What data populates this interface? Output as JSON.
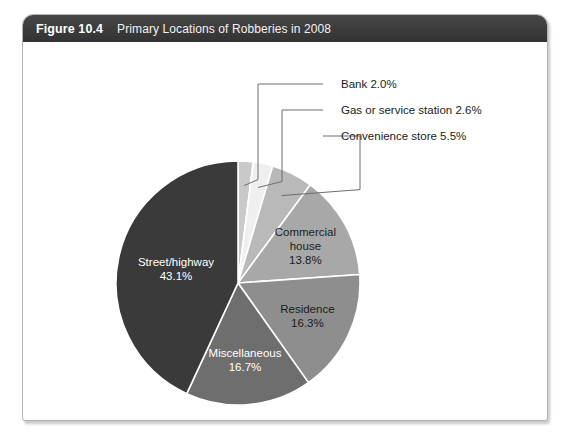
{
  "figure": {
    "number": "Figure 10.4",
    "title": "Primary Locations of Robberies in 2008"
  },
  "chart_data": {
    "type": "pie",
    "title": "Primary Locations of Robberies in 2008",
    "value_unit": "percent",
    "total": 100.0,
    "legend_position": "none",
    "grid": false,
    "labels_inside": true,
    "categories": [
      "Bank",
      "Gas or service station",
      "Convenience store",
      "Commercial house",
      "Residence",
      "Miscellaneous",
      "Street/highway"
    ],
    "values": [
      2.0,
      2.6,
      5.5,
      13.8,
      16.3,
      16.7,
      43.1
    ],
    "slices": [
      {
        "name": "Bank",
        "value": 2.0,
        "value_label": "2.0%",
        "callout_label": "Bank 2.0%",
        "color": "#c9c9c9",
        "label_style": "callout",
        "label_text_color": "#1c1c1c"
      },
      {
        "name": "Gas or service station",
        "value": 2.6,
        "value_label": "2.6%",
        "callout_label": "Gas or service station 2.6%",
        "color": "#efefef",
        "label_style": "callout",
        "label_text_color": "#1c1c1c"
      },
      {
        "name": "Convenience store",
        "value": 5.5,
        "value_label": "5.5%",
        "callout_label": "Convenience store 5.5%",
        "color": "#b9b9b9",
        "label_style": "callout",
        "label_text_color": "#1c1c1c"
      },
      {
        "name": "Commercial house",
        "value": 13.8,
        "value_label": "13.8%",
        "inside_line1": "Commercial",
        "inside_line2": "house",
        "inside_line3": "13.8%",
        "color": "#a8a8a8",
        "label_style": "inside",
        "label_text_color": "#1c1c1c"
      },
      {
        "name": "Residence",
        "value": 16.3,
        "value_label": "16.3%",
        "inside_line1": "Residence",
        "inside_line2": "16.3%",
        "color": "#8e8e8e",
        "label_style": "inside",
        "label_text_color": "#1c1c1c"
      },
      {
        "name": "Miscellaneous",
        "value": 16.7,
        "value_label": "16.7%",
        "inside_line1": "Miscellaneous",
        "inside_line2": "16.7%",
        "color": "#6e6e6e",
        "label_style": "inside",
        "label_text_color": "#ffffff"
      },
      {
        "name": "Street/highway",
        "value": 43.1,
        "value_label": "43.1%",
        "inside_line1": "Street/highway",
        "inside_line2": "43.1%",
        "color": "#3a3a3a",
        "label_style": "inside",
        "label_text_color": "#ffffff"
      }
    ]
  },
  "colors": {
    "header_bar": "#3d3d3d",
    "card_border": "#b3b3b3",
    "page_background": "#ffffff",
    "leader_line": "#6d6d6d"
  }
}
